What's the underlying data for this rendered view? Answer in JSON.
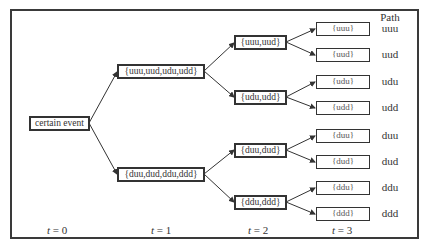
{
  "diagram": {
    "type": "event-tree",
    "root": {
      "label": "certain event"
    },
    "level1": [
      {
        "label": "{uuu,uud,udu,udd}"
      },
      {
        "label": "{duu,dud,ddu,ddd}"
      }
    ],
    "level2": [
      {
        "label": "{uuu,uud}"
      },
      {
        "label": "{udu,udd}"
      },
      {
        "label": "{duu,dud}"
      },
      {
        "label": "{ddu,ddd}"
      }
    ],
    "level3": [
      {
        "label": "{uuu}"
      },
      {
        "label": "{uud}"
      },
      {
        "label": "{udu}"
      },
      {
        "label": "{udd}"
      },
      {
        "label": "{duu}"
      },
      {
        "label": "{dud}"
      },
      {
        "label": "{ddu}"
      },
      {
        "label": "{ddd}"
      }
    ],
    "path_header": "Path",
    "paths": [
      "uuu",
      "uud",
      "udu",
      "udd",
      "duu",
      "dud",
      "ddu",
      "ddd"
    ],
    "time_labels": [
      {
        "var": "t",
        "eq": " = 0"
      },
      {
        "var": "t",
        "eq": " = 1"
      },
      {
        "var": "t",
        "eq": " = 2"
      },
      {
        "var": "t",
        "eq": " = 3"
      }
    ],
    "colors": {
      "line": "#333333",
      "border": "#333333",
      "background": "#ffffff"
    }
  }
}
